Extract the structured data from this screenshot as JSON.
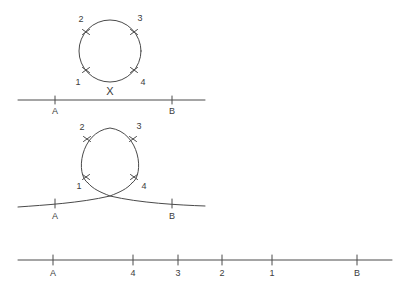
{
  "figure": {
    "title": "",
    "background_color": "#ffffff",
    "ink_color": "#4a4a4a",
    "panels": [
      {
        "id": "panel-top",
        "description": "circle above straight line",
        "circle": {
          "center_x": 110,
          "center_y": 51,
          "radius": 31,
          "markers": [
            {
              "label": "1",
              "angle_deg": 205,
              "label_x": 78,
              "label_y": 84
            },
            {
              "label": "2",
              "angle_deg": 155,
              "label_x": 81,
              "label_y": 19
            },
            {
              "label": "3",
              "angle_deg": 25,
              "label_x": 140,
              "label_y": 18
            },
            {
              "label": "4",
              "angle_deg": 335,
              "label_x": 143,
              "label_y": 84
            }
          ]
        },
        "cross_mark": {
          "label": "X",
          "x": 110,
          "y": 92
        },
        "line": {
          "start_x": 18,
          "end_x": 205,
          "y": 100,
          "ticks": [
            {
              "label": "A",
              "x": 55
            },
            {
              "label": "B",
              "x": 172
            }
          ]
        }
      },
      {
        "id": "panel-middle",
        "description": "looped curve crossing itself above a curved line",
        "circle": {
          "center_x": 110,
          "center_y": 158,
          "radius": 30,
          "markers": [
            {
              "label": "1",
              "angle_deg": 208,
              "label_x": 79,
              "label_y": 187
            },
            {
              "label": "2",
              "angle_deg": 152,
              "label_x": 82,
              "label_y": 127
            },
            {
              "label": "3",
              "angle_deg": 28,
              "label_x": 139,
              "label_y": 126
            },
            {
              "label": "4",
              "angle_deg": 332,
              "label_x": 143,
              "label_y": 188
            }
          ]
        },
        "line": {
          "start_x": 18,
          "end_x": 205,
          "y": 202,
          "ticks": [
            {
              "label": "A",
              "x": 55
            },
            {
              "label": "B",
              "x": 172
            }
          ]
        }
      },
      {
        "id": "panel-bottom",
        "description": "straight line with reordered points",
        "line": {
          "start_x": 18,
          "end_x": 392,
          "y": 260,
          "ticks": [
            {
              "label": "A",
              "x": 53
            },
            {
              "label": "4",
              "x": 133
            },
            {
              "label": "3",
              "x": 178
            },
            {
              "label": "2",
              "x": 222
            },
            {
              "label": "1",
              "x": 272
            },
            {
              "label": "B",
              "x": 357
            }
          ]
        }
      }
    ]
  }
}
